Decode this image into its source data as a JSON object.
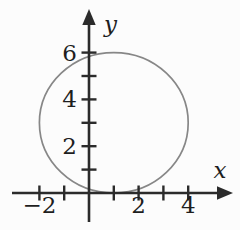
{
  "figure": {
    "background_color": "#fcfcfc",
    "axis_color": "#2b2b2b",
    "curve_color": "#878787",
    "label_color": "#1e1e1e",
    "x_axis": {
      "label": "x",
      "ticks": [
        -2,
        -1,
        1,
        2,
        3,
        4
      ],
      "tick_labels": [
        {
          "value": -2,
          "text": "−2"
        },
        {
          "value": 2,
          "text": "2"
        },
        {
          "value": 4,
          "text": "4"
        }
      ]
    },
    "y_axis": {
      "label": "y",
      "ticks": [
        1,
        2,
        3,
        4,
        5,
        6
      ],
      "tick_labels": [
        {
          "value": 2,
          "text": "2"
        },
        {
          "value": 4,
          "text": "4"
        },
        {
          "value": 6,
          "text": "6"
        }
      ]
    },
    "circle": {
      "center_x": 1,
      "center_y": 3,
      "radius": 3
    }
  },
  "chart_data": {
    "type": "line",
    "title": "",
    "xlabel": "x",
    "ylabel": "y",
    "xlim": [
      -3.1,
      5.9
    ],
    "ylim": [
      -1.6,
      7.9
    ],
    "x_ticks": [
      -2,
      -1,
      1,
      2,
      3,
      4
    ],
    "labeled_x_ticks": [
      -2,
      2,
      4
    ],
    "y_ticks": [
      1,
      2,
      3,
      4,
      5,
      6
    ],
    "labeled_y_ticks": [
      2,
      4,
      6
    ],
    "grid": false,
    "legend": false,
    "series": [
      {
        "name": "circle",
        "shape": "circle",
        "center": [
          1,
          3
        ],
        "radius": 3,
        "key_points": [
          [
            1,
            0
          ],
          [
            1,
            6
          ],
          [
            -2,
            3
          ],
          [
            4,
            3
          ]
        ],
        "note": "circle tangent to the x-axis at (1, 0), top touching y = 6"
      }
    ]
  }
}
